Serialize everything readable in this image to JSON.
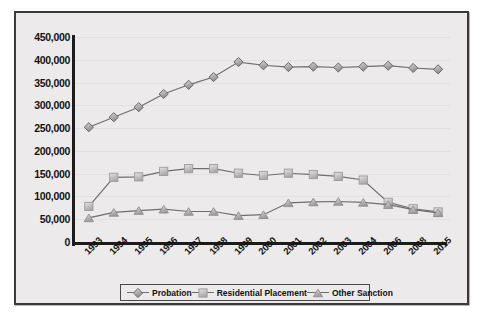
{
  "chart_data": {
    "type": "line",
    "title": "",
    "xlabel": "",
    "ylabel": "",
    "ylim": [
      0,
      450000
    ],
    "ytick_labels": [
      "450,000",
      "400,000",
      "350,000",
      "300,000",
      "250,000",
      "200,000",
      "150,000",
      "100,000",
      "50,000",
      "0"
    ],
    "ytick_values": [
      450000,
      400000,
      350000,
      300000,
      250000,
      200000,
      150000,
      100000,
      50000,
      0
    ],
    "grid": true,
    "legend_position": "bottom",
    "categories": [
      "1993",
      "1994",
      "1995",
      "1996",
      "1997",
      "1998",
      "1999",
      "2000",
      "2001",
      "2002",
      "2003",
      "2004",
      "2006",
      "2008",
      "2015"
    ],
    "series": [
      {
        "name": "Probation",
        "marker": "diamond",
        "color": "#9a9a9a",
        "values": [
          252000,
          274000,
          296000,
          325000,
          345000,
          362000,
          395000,
          388000,
          384000,
          385000,
          383000,
          385000,
          387000,
          382000,
          379000
        ]
      },
      {
        "name": "Residential Placement",
        "marker": "square",
        "color": "#b5b5b5",
        "values": [
          78000,
          142000,
          143000,
          155000,
          161000,
          161000,
          151000,
          146000,
          151000,
          148000,
          144000,
          136000,
          87000,
          73000,
          66000
        ]
      },
      {
        "name": "Other Sanction",
        "marker": "triangle",
        "color": "#a8a8a8",
        "values": [
          53000,
          65000,
          69000,
          72000,
          67000,
          67000,
          58000,
          60000,
          86000,
          88000,
          89000,
          87000,
          82000,
          71000,
          64000
        ]
      }
    ]
  },
  "legend": {
    "items": [
      {
        "label": "Probation"
      },
      {
        "label": "Residential Placement"
      },
      {
        "label": "Other Sanction"
      }
    ]
  },
  "colors": {
    "frame_border": "#3a3a3a",
    "plot_background": "#eceaea",
    "axis": "#1c1c1c",
    "gridline": "#e2e0e0",
    "line": "#6e6e6e",
    "text": "#131313"
  }
}
